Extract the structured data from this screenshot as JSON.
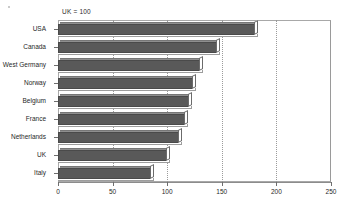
{
  "chart_data": {
    "type": "bar",
    "orientation": "horizontal",
    "title": "",
    "subtitle": "",
    "annotation": "UK = 100",
    "xlabel": "",
    "ylabel": "",
    "xlim": [
      0,
      250
    ],
    "xticks": [
      0,
      50,
      100,
      150,
      200,
      250
    ],
    "xtick_labels": [
      "0",
      "50",
      "100",
      "150",
      "200",
      "250"
    ],
    "grid": "vertical-dotted",
    "legend": "none",
    "categories": [
      "USA",
      "Canada",
      "West Germany",
      "Norway",
      "Belgium",
      "France",
      "Netherlands",
      "UK",
      "Italy"
    ],
    "values": [
      180,
      146,
      130,
      124,
      120,
      116,
      111,
      100,
      85
    ],
    "bars": [
      {
        "label": "USA",
        "value": 180
      },
      {
        "label": "Canada",
        "value": 146
      },
      {
        "label": "West Germany",
        "value": 130
      },
      {
        "label": "Norway",
        "value": 124
      },
      {
        "label": "Belgium",
        "value": 120
      },
      {
        "label": "France",
        "value": 116
      },
      {
        "label": "Netherlands",
        "value": 111
      },
      {
        "label": "UK",
        "value": 100
      },
      {
        "label": "Italy",
        "value": 85
      }
    ],
    "colors": {
      "bar_fill": "#595959",
      "bar_edge": "#4a4a4a",
      "bar_highlight": "#ffffff",
      "grid": "#9b9b9b",
      "axis": "#8c8c8c",
      "text": "#1f1f1f",
      "background": "#ffffff"
    }
  }
}
